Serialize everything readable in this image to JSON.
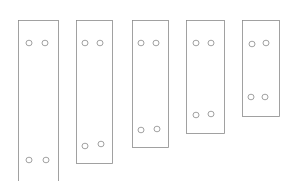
{
  "drawing": {
    "description": "Hand-drawn sketch of five rectangular plates of decreasing length, each with four holes",
    "stroke_color": "#8a8a8a",
    "background": "#ffffff",
    "plates": [
      {
        "x": 18,
        "y": 20,
        "w": 40,
        "h": 165,
        "holes": [
          [
            29,
            43
          ],
          [
            45,
            43
          ],
          [
            29,
            160
          ],
          [
            46,
            160
          ]
        ]
      },
      {
        "x": 76,
        "y": 20,
        "w": 36,
        "h": 143,
        "holes": [
          [
            85,
            43
          ],
          [
            100,
            43
          ],
          [
            85,
            146
          ],
          [
            101,
            144
          ]
        ]
      },
      {
        "x": 132,
        "y": 20,
        "w": 36,
        "h": 127,
        "holes": [
          [
            141,
            43
          ],
          [
            156,
            43
          ],
          [
            141,
            130
          ],
          [
            157,
            129
          ]
        ]
      },
      {
        "x": 186,
        "y": 20,
        "w": 38,
        "h": 113,
        "holes": [
          [
            196,
            43
          ],
          [
            211,
            43
          ],
          [
            196,
            115
          ],
          [
            211,
            114
          ]
        ]
      },
      {
        "x": 242,
        "y": 20,
        "w": 37,
        "h": 96,
        "holes": [
          [
            252,
            44
          ],
          [
            266,
            43
          ],
          [
            251,
            97
          ],
          [
            265,
            97
          ]
        ]
      }
    ]
  }
}
